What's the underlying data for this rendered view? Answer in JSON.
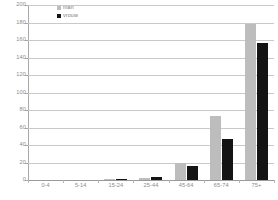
{
  "chart_data": {
    "type": "bar",
    "title": "",
    "subtitle": "",
    "xlabel": "",
    "ylabel": "",
    "ylim": [
      0,
      200
    ],
    "yticks": [
      0,
      20,
      40,
      60,
      80,
      100,
      120,
      140,
      160,
      180,
      200
    ],
    "ytick_labels": [
      "0",
      "20",
      "40",
      "60",
      "80",
      "100",
      "120",
      "140",
      "160",
      "180",
      "200"
    ],
    "grid": true,
    "legend_position": "top-left",
    "categories": [
      "0-4",
      "5-14",
      "15-24",
      "25-44",
      "45-64",
      "65-74",
      "75+"
    ],
    "series": [
      {
        "name": "man",
        "color": "#bdbdbd",
        "values": [
          0,
          0,
          1,
          2,
          19,
          73,
          178
        ]
      },
      {
        "name": "vrouw",
        "color": "#141414",
        "values": [
          0,
          0,
          1,
          3,
          16,
          47,
          157
        ]
      }
    ]
  },
  "legend": {
    "items": [
      {
        "label": "man",
        "color": "#bdbdbd"
      },
      {
        "label": "vrouw",
        "color": "#141414"
      }
    ]
  },
  "colors": {
    "gridline": "#c9c9c9",
    "axis": "#a8a8a8",
    "tick_text": "#8a8a8a",
    "background": "#ffffff"
  }
}
